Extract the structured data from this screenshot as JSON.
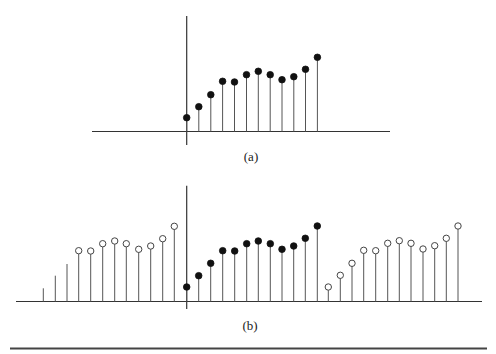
{
  "figure": {
    "panels": [
      {
        "id": "a",
        "caption": "(a)",
        "caption_pos": {
          "x": 251,
          "y": 149
        },
        "axes": {
          "h": {
            "x1": 92,
            "x2": 390,
            "y": 131.5
          },
          "v": {
            "x": 186.7,
            "y1": 16,
            "y2": 145
          }
        },
        "baseline_y": 131.5,
        "stems": [
          {
            "x": 186.7,
            "y": 117.7,
            "marker": "filled"
          },
          {
            "x": 198.8,
            "y": 106.7,
            "marker": "filled"
          },
          {
            "x": 210.8,
            "y": 94.7,
            "marker": "filled"
          },
          {
            "x": 222.6,
            "y": 81.3,
            "marker": "filled"
          },
          {
            "x": 234.5,
            "y": 82.0,
            "marker": "filled"
          },
          {
            "x": 246.5,
            "y": 74.7,
            "marker": "filled"
          },
          {
            "x": 258.3,
            "y": 71.3,
            "marker": "filled"
          },
          {
            "x": 270.2,
            "y": 74.7,
            "marker": "filled"
          },
          {
            "x": 282.0,
            "y": 79.7,
            "marker": "filled"
          },
          {
            "x": 293.8,
            "y": 76.7,
            "marker": "filled"
          },
          {
            "x": 305.5,
            "y": 69.3,
            "marker": "filled"
          },
          {
            "x": 317.4,
            "y": 57.3,
            "marker": "filled"
          }
        ]
      },
      {
        "id": "b",
        "caption": "(b)",
        "caption_pos": {
          "x": 250,
          "y": 318
        },
        "axes": {
          "h": {
            "x1": 16,
            "x2": 482,
            "y": 301.5
          },
          "v": {
            "x": 186.7,
            "y1": 185.7,
            "y2": 309
          }
        },
        "baseline_y": 301.5,
        "stems": [
          {
            "x": 43.3,
            "y": 288.3,
            "marker": "none"
          },
          {
            "x": 55.3,
            "y": 275.7,
            "marker": "none"
          },
          {
            "x": 67.0,
            "y": 264.0,
            "marker": "none"
          },
          {
            "x": 78.7,
            "y": 250.7,
            "marker": "open"
          },
          {
            "x": 90.7,
            "y": 251.0,
            "marker": "open"
          },
          {
            "x": 102.7,
            "y": 243.7,
            "marker": "open"
          },
          {
            "x": 114.7,
            "y": 241.0,
            "marker": "open"
          },
          {
            "x": 126.3,
            "y": 243.7,
            "marker": "open"
          },
          {
            "x": 138.7,
            "y": 249.3,
            "marker": "open"
          },
          {
            "x": 150.7,
            "y": 246.0,
            "marker": "open"
          },
          {
            "x": 162.7,
            "y": 238.7,
            "marker": "open"
          },
          {
            "x": 174.3,
            "y": 226.3,
            "marker": "open"
          },
          {
            "x": 186.7,
            "y": 287.0,
            "marker": "filled"
          },
          {
            "x": 198.7,
            "y": 275.7,
            "marker": "filled"
          },
          {
            "x": 210.7,
            "y": 263.3,
            "marker": "filled"
          },
          {
            "x": 222.7,
            "y": 250.7,
            "marker": "filled"
          },
          {
            "x": 234.7,
            "y": 251.0,
            "marker": "filled"
          },
          {
            "x": 246.7,
            "y": 243.7,
            "marker": "filled"
          },
          {
            "x": 258.3,
            "y": 241.0,
            "marker": "filled"
          },
          {
            "x": 270.3,
            "y": 243.7,
            "marker": "filled"
          },
          {
            "x": 282.0,
            "y": 249.3,
            "marker": "filled"
          },
          {
            "x": 293.7,
            "y": 246.0,
            "marker": "filled"
          },
          {
            "x": 305.3,
            "y": 238.3,
            "marker": "filled"
          },
          {
            "x": 317.3,
            "y": 226.0,
            "marker": "filled"
          },
          {
            "x": 328.3,
            "y": 287.0,
            "marker": "open"
          },
          {
            "x": 340.3,
            "y": 275.3,
            "marker": "open"
          },
          {
            "x": 352.0,
            "y": 263.3,
            "marker": "open"
          },
          {
            "x": 363.7,
            "y": 250.3,
            "marker": "open"
          },
          {
            "x": 375.7,
            "y": 250.7,
            "marker": "open"
          },
          {
            "x": 387.7,
            "y": 243.3,
            "marker": "open"
          },
          {
            "x": 399.3,
            "y": 240.7,
            "marker": "open"
          },
          {
            "x": 411.0,
            "y": 243.3,
            "marker": "open"
          },
          {
            "x": 423.0,
            "y": 249.0,
            "marker": "open"
          },
          {
            "x": 434.7,
            "y": 245.7,
            "marker": "open"
          },
          {
            "x": 446.3,
            "y": 238.3,
            "marker": "open"
          },
          {
            "x": 458.0,
            "y": 226.0,
            "marker": "open"
          }
        ]
      }
    ],
    "bottom_rule": {
      "x1": 10,
      "x2": 487,
      "y": 348.5
    },
    "colors": {
      "filled_marker": "#111111",
      "open_marker_stroke": "#444444",
      "stem": "#555555",
      "axis": "#333333"
    }
  }
}
